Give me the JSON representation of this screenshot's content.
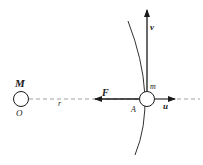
{
  "diagram": {
    "labels": {
      "central_mass": "M",
      "origin": "O",
      "distance": "r",
      "force": "F",
      "velocity": "v",
      "orbiting_mass": "m",
      "point": "A",
      "unit_vector": "u"
    },
    "colors": {
      "stroke": "#1a1a1a",
      "dashed": "#888888",
      "background": "#ffffff"
    }
  }
}
